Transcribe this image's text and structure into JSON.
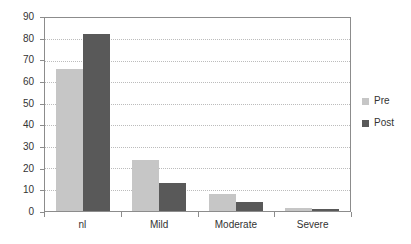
{
  "chart_data": {
    "type": "bar",
    "title": "",
    "subtitle": "",
    "xlabel": "",
    "ylabel": "",
    "categories": [
      "nl",
      "Mild",
      "Moderate",
      "Severe"
    ],
    "series": [
      {
        "name": "Pre",
        "values": [
          66,
          24,
          8,
          1.5
        ],
        "color": "#c6c6c6"
      },
      {
        "name": "Post",
        "values": [
          82.5,
          13,
          4,
          1
        ],
        "color": "#595959"
      }
    ],
    "ylim": [
      0,
      90
    ],
    "ytick_step": 10,
    "yticks": [
      0,
      10,
      20,
      30,
      40,
      50,
      60,
      70,
      80,
      90
    ],
    "ytick_labels": [
      "0",
      "10",
      "20",
      "30",
      "40",
      "50",
      "60",
      "70",
      "80",
      "90"
    ],
    "grid": true,
    "grid_axis": "y",
    "grid_style": "dotted",
    "legend_position": "right",
    "legend_entries": [
      "Pre",
      "Post"
    ],
    "background_color": "#ffffff",
    "axis_color": "#8c8c8c",
    "gridline_color": "#bcbcbc",
    "text_color": "#333333"
  }
}
